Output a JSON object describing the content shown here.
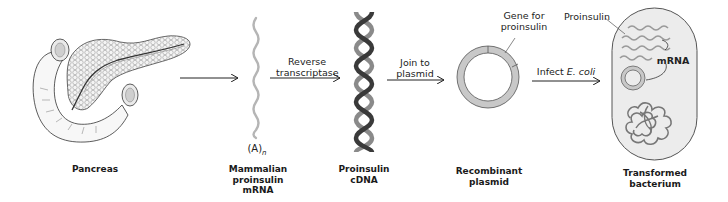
{
  "stages": [
    {
      "id": "pancreas",
      "label_lines": [
        "Pancreas"
      ]
    },
    {
      "id": "mrna",
      "label_lines": [
        "Mammalian",
        "proinsulin",
        "mRNA"
      ]
    },
    {
      "id": "cdna",
      "label_lines": [
        "Proinsulin",
        "cDNA"
      ]
    },
    {
      "id": "plasmid",
      "label_lines": [
        "Recombinant",
        "plasmid"
      ]
    },
    {
      "id": "bacterium",
      "label_lines": [
        "Transformed",
        "bacterium"
      ]
    }
  ],
  "steps": [
    {
      "id": "step1",
      "label_lines": []
    },
    {
      "id": "step2",
      "label_lines": [
        "Reverse",
        "transcriptase"
      ]
    },
    {
      "id": "step3",
      "label_lines": [
        "Join to",
        "plasmid"
      ]
    },
    {
      "id": "step4",
      "label_prefix": "Infect ",
      "label_italic": "E. coli"
    }
  ],
  "annotations": {
    "poly_a": "(A)",
    "poly_a_subscript": "n",
    "gene_callout_lines": [
      "Gene for",
      "proinsulin"
    ],
    "proinsulin_callout": "Proinsulin",
    "mrna_callout": "mRNA"
  },
  "colors": {
    "background": "#ffffff",
    "strand_gray": "#b5b5b5",
    "plasmid_fill": "#c8c8c8",
    "outline": "#555555",
    "bacterium_fill": "#ececec",
    "helix_dark": "#3a3a3a",
    "helix_light": "#8a8a8a",
    "arrow": "#222222"
  }
}
